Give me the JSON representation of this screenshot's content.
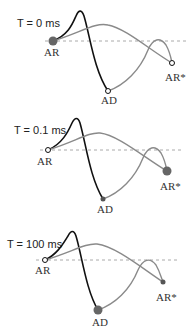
{
  "colors": {
    "black_curve": "#111111",
    "grey_curve": "#8a8a8a",
    "dashed": "#aaaaaa",
    "marker_fill": "#666666"
  },
  "panels": [
    {
      "title": "T = 0 ms",
      "labels": {
        "start": "AR",
        "bottom": "AD",
        "end": "AR*"
      },
      "highlight": "AR"
    },
    {
      "title": "T = 0.1 ms",
      "labels": {
        "start": "AR",
        "bottom": "AD",
        "end": "AR*"
      },
      "highlight": "AR*"
    },
    {
      "title": "T = 100 ms",
      "labels": {
        "start": "AR",
        "bottom": "AD",
        "end": "AR*"
      },
      "highlight": "AD"
    }
  ]
}
